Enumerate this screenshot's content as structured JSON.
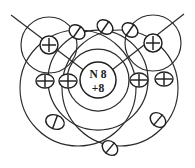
{
  "figure": {
    "background_color": "#ffffff",
    "ink_color": "#2b2b2b",
    "width": 195,
    "height": 168
  },
  "oxygen": {
    "nucleus_label_element": "N 8",
    "nucleus_label_charge": "+8",
    "nucleus_center_x": 98,
    "nucleus_center_y": 80,
    "nucleus_radius": 18,
    "inner_shell_radius": 31,
    "outer_shell_radius": 50
  },
  "hydrogen_left": {
    "nucleus_label": "+",
    "nucleus_center_x": 49,
    "nucleus_center_y": 45,
    "nucleus_radius": 9,
    "orbit_radius": 28
  },
  "hydrogen_right": {
    "nucleus_label": "+",
    "nucleus_center_x": 153,
    "nucleus_center_y": 43,
    "nucleus_radius": 9,
    "orbit_radius": 28
  },
  "bond_lines": [
    {
      "name": "bond-axis-left",
      "x1": 11,
      "y1": 15,
      "x2": 106,
      "y2": 87
    },
    {
      "name": "bond-axis-right",
      "x1": 184,
      "y1": 14,
      "x2": 90,
      "y2": 87
    }
  ],
  "shared_orbits": [
    {
      "name": "shared-orbit-left",
      "cx": 78,
      "cy": 88,
      "rx": 58,
      "ry": 58
    },
    {
      "name": "shared-orbit-right",
      "cx": 120,
      "cy": 88,
      "rx": 58,
      "ry": 58
    }
  ],
  "electrons_cross": [
    {
      "name": "electron-cross-left-nucleus",
      "x": 49,
      "y": 45,
      "r": 8.5
    },
    {
      "name": "electron-cross-right-nucleus",
      "x": 153,
      "y": 43,
      "r": 8.5
    },
    {
      "name": "electron-cross-left-outer",
      "x": 45,
      "y": 81,
      "r": 8.0
    },
    {
      "name": "electron-cross-left-inner",
      "x": 68,
      "y": 81,
      "r": 8.0
    },
    {
      "name": "electron-cross-right-inner",
      "x": 139,
      "y": 80,
      "r": 8.0
    },
    {
      "name": "electron-cross-right-outer",
      "x": 164,
      "y": 79,
      "r": 8.0
    }
  ],
  "electrons_slash": [
    {
      "name": "electron-slash-top-left",
      "x": 77,
      "y": 32,
      "r": 8.0,
      "angle": 35
    },
    {
      "name": "electron-slash-top-center",
      "x": 105,
      "y": 27,
      "r": 8.0,
      "angle": 35
    },
    {
      "name": "electron-slash-top-right",
      "x": 130,
      "y": 30,
      "r": 8.0,
      "angle": 35
    },
    {
      "name": "electron-slash-bottom-left",
      "x": 55,
      "y": 122,
      "r": 8.0,
      "angle": 20
    },
    {
      "name": "electron-slash-bottom-center",
      "x": 110,
      "y": 148,
      "r": 8.0,
      "angle": 40
    },
    {
      "name": "electron-slash-bottom-right",
      "x": 158,
      "y": 120,
      "r": 8.0,
      "angle": 40
    }
  ],
  "legend": {
    "electron_cross_symbol": "cross-circle-electron",
    "electron_slash_symbol": "slash-circle-electron",
    "proton_symbol": "plus-nucleus"
  }
}
